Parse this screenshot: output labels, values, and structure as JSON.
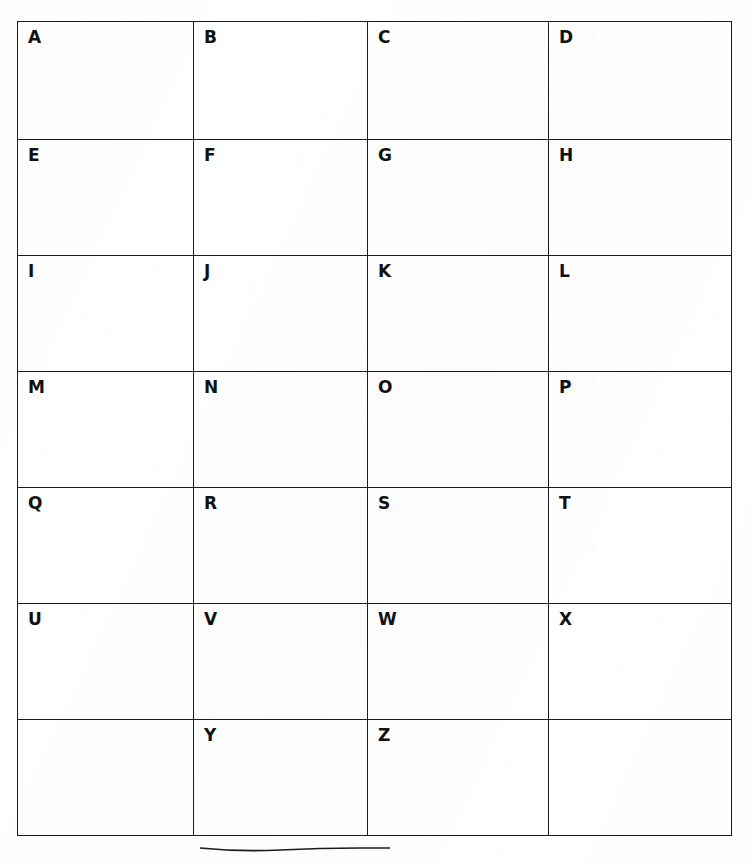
{
  "document": {
    "kind": "worksheet",
    "title": "Alphabet Grid Worksheet",
    "columns": 4,
    "rows": 7,
    "ink_color": "#1c1c1c",
    "paper_color": "#ffffff"
  },
  "grid": {
    "rows": [
      {
        "index": 1,
        "cells": [
          {
            "letter": "A",
            "empty": false
          },
          {
            "letter": "B",
            "empty": false
          },
          {
            "letter": "C",
            "empty": false
          },
          {
            "letter": "D",
            "empty": false
          }
        ]
      },
      {
        "index": 2,
        "cells": [
          {
            "letter": "E",
            "empty": false
          },
          {
            "letter": "F",
            "empty": false
          },
          {
            "letter": "G",
            "empty": false
          },
          {
            "letter": "H",
            "empty": false
          }
        ]
      },
      {
        "index": 3,
        "cells": [
          {
            "letter": "I",
            "empty": false
          },
          {
            "letter": "J",
            "empty": false
          },
          {
            "letter": "K",
            "empty": false
          },
          {
            "letter": "L",
            "empty": false
          }
        ]
      },
      {
        "index": 4,
        "cells": [
          {
            "letter": "M",
            "empty": false
          },
          {
            "letter": "N",
            "empty": false
          },
          {
            "letter": "O",
            "empty": false
          },
          {
            "letter": "P",
            "empty": false
          }
        ]
      },
      {
        "index": 5,
        "cells": [
          {
            "letter": "Q",
            "empty": false
          },
          {
            "letter": "R",
            "empty": false
          },
          {
            "letter": "S",
            "empty": false
          },
          {
            "letter": "T",
            "empty": false
          }
        ]
      },
      {
        "index": 6,
        "cells": [
          {
            "letter": "U",
            "empty": false
          },
          {
            "letter": "V",
            "empty": false
          },
          {
            "letter": "W",
            "empty": false
          },
          {
            "letter": "X",
            "empty": false
          }
        ]
      },
      {
        "index": 7,
        "cells": [
          {
            "letter": "",
            "empty": true
          },
          {
            "letter": "Y",
            "empty": false
          },
          {
            "letter": "Z",
            "empty": false
          },
          {
            "letter": "",
            "empty": true
          }
        ]
      }
    ]
  }
}
